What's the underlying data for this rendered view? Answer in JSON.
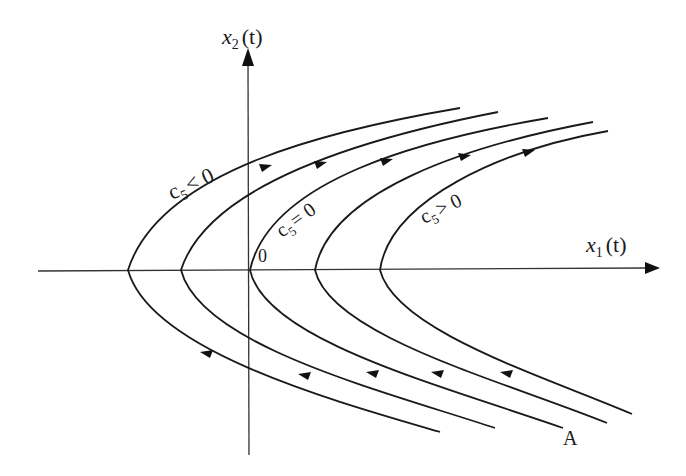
{
  "diagram": {
    "type": "phase-portrait",
    "axes": {
      "x_label": "x",
      "x_sub": "1",
      "x_arg": "(t)",
      "y_label": "x",
      "y_sub": "2",
      "y_arg": "(t)",
      "origin_label": "0"
    },
    "curve_labels": {
      "negative": {
        "c": "c",
        "sub": "5",
        "rel": "< 0"
      },
      "zero": {
        "c": "c",
        "sub": "5",
        "rel": "= 0"
      },
      "positive": {
        "c": "c",
        "sub": "5",
        "rel": "> 0"
      }
    },
    "point_label": "A",
    "curves": [
      {
        "id": "c1",
        "vertex_x": 128,
        "region": "c5<0"
      },
      {
        "id": "c2",
        "vertex_x": 181,
        "region": "c5<0"
      },
      {
        "id": "c3",
        "vertex_x": 250,
        "region": "c5=0"
      },
      {
        "id": "c4",
        "vertex_x": 315,
        "region": "c5>0"
      },
      {
        "id": "c5",
        "vertex_x": 380,
        "region": "c5>0"
      }
    ],
    "flow_direction": "upper branches flow right, lower branches flow left"
  }
}
